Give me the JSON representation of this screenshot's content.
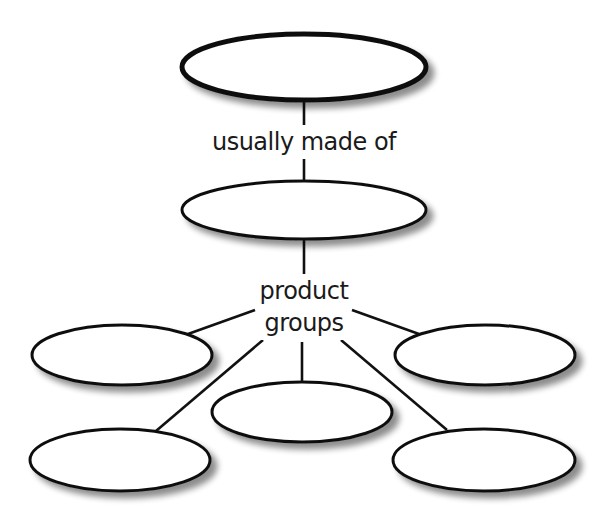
{
  "diagram": {
    "type": "concept-map",
    "colors": {
      "stroke": "#111111",
      "fill": "#ffffff",
      "shadow": "#9a9a9a",
      "text": "#1a1a1a"
    },
    "nodes": [
      {
        "id": "top",
        "label": "",
        "cx": 304,
        "cy": 67,
        "rx": 122,
        "ry": 33,
        "stroke_width": 5
      },
      {
        "id": "middle",
        "label": "",
        "cx": 304,
        "cy": 210,
        "rx": 122,
        "ry": 29,
        "stroke_width": 3
      },
      {
        "id": "group-left",
        "label": "",
        "cx": 122,
        "cy": 355,
        "rx": 90,
        "ry": 30,
        "stroke_width": 3
      },
      {
        "id": "group-right",
        "label": "",
        "cx": 485,
        "cy": 355,
        "rx": 90,
        "ry": 30,
        "stroke_width": 3
      },
      {
        "id": "group-center",
        "label": "",
        "cx": 302,
        "cy": 412,
        "rx": 90,
        "ry": 30,
        "stroke_width": 3
      },
      {
        "id": "group-bottom-left",
        "label": "",
        "cx": 120,
        "cy": 460,
        "rx": 90,
        "ry": 31,
        "stroke_width": 3
      },
      {
        "id": "group-bottom-right",
        "label": "",
        "cx": 484,
        "cy": 460,
        "rx": 91,
        "ry": 31,
        "stroke_width": 3
      }
    ],
    "link_labels": {
      "usually_made_of": "usually made of",
      "product": "product",
      "groups": "groups"
    },
    "connectors": [
      {
        "from": "top",
        "to": "label-usually-made-of",
        "x1": 304,
        "y1": 100,
        "x2": 304,
        "y2": 125
      },
      {
        "from": "label-usually-made-of",
        "to": "middle",
        "x1": 304,
        "y1": 156,
        "x2": 304,
        "y2": 181
      },
      {
        "from": "middle",
        "to": "label-product-groups",
        "x1": 304,
        "y1": 239,
        "x2": 304,
        "y2": 274
      },
      {
        "from": "label-product-groups",
        "to": "group-left",
        "x1": 255,
        "y1": 310,
        "x2": 188,
        "y2": 334
      },
      {
        "from": "label-product-groups",
        "to": "group-right",
        "x1": 352,
        "y1": 310,
        "x2": 419,
        "y2": 334
      },
      {
        "from": "label-product-groups",
        "to": "group-center",
        "x1": 302,
        "y1": 342,
        "x2": 302,
        "y2": 382
      },
      {
        "from": "label-product-groups",
        "to": "group-bottom-left",
        "x1": 263,
        "y1": 340,
        "x2": 156,
        "y2": 431
      },
      {
        "from": "label-product-groups",
        "to": "group-bottom-right",
        "x1": 341,
        "y1": 340,
        "x2": 447,
        "y2": 430
      }
    ]
  }
}
